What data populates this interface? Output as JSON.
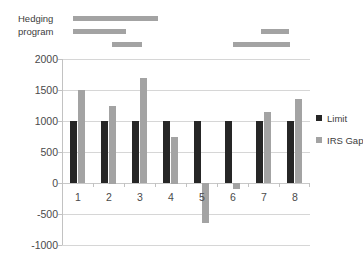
{
  "annotation": {
    "label_line1": "Hedging",
    "label_line2": "program",
    "segments": [
      {
        "name": "segment-row1-a",
        "left": 73,
        "top": 16,
        "width": 85
      },
      {
        "name": "segment-row2-a",
        "left": 73,
        "top": 29,
        "width": 53
      },
      {
        "name": "segment-row3-a",
        "left": 112,
        "top": 42,
        "width": 30
      },
      {
        "name": "segment-row2-b",
        "left": 261,
        "top": 29,
        "width": 28
      },
      {
        "name": "segment-row3-b",
        "left": 233,
        "top": 42,
        "width": 57
      }
    ]
  },
  "legend": {
    "position": "right",
    "entries": [
      {
        "label": "Limit",
        "color": "#262626"
      },
      {
        "label": "IRS Gap",
        "color": "#a3a3a3"
      }
    ]
  },
  "colors": {
    "limit": "#262626",
    "irs_gap": "#a3a3a3",
    "grid": "#d6d6d6",
    "axis": "#c2c2c2",
    "text": "#4a4a4a",
    "background": "#ffffff"
  },
  "chart_data": {
    "type": "bar",
    "title": "",
    "subtitle": "",
    "xlabel": "",
    "ylabel": "",
    "categories": [
      "1",
      "2",
      "3",
      "4",
      "5",
      "6",
      "7",
      "8"
    ],
    "series": [
      {
        "name": "Limit",
        "color": "#262626",
        "values": [
          1000,
          1000,
          1000,
          1000,
          1000,
          1000,
          1000,
          1000
        ]
      },
      {
        "name": "IRS Gap",
        "color": "#a3a3a3",
        "values": [
          1500,
          1250,
          1700,
          750,
          -650,
          -100,
          1150,
          1350
        ]
      }
    ],
    "ylim": [
      -1000,
      2000
    ],
    "ytick_step": 500,
    "yticks": [
      2000,
      1500,
      1000,
      500,
      0,
      -500,
      -1000
    ],
    "ytick_labels": [
      "2000",
      "1500",
      "1000",
      "500",
      "0",
      "-500",
      "-1000"
    ],
    "grid": true,
    "grid_axis": "y",
    "legend_position": "right",
    "annotations": [
      "Hedging program"
    ]
  }
}
